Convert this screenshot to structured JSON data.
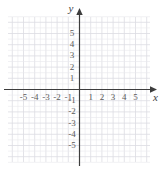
{
  "chart_data": {
    "type": "scatter",
    "title": "",
    "xlabel": "x",
    "ylabel": "y",
    "xlim": [
      -6,
      6
    ],
    "ylim": [
      -6,
      6
    ],
    "grid": true,
    "legend": null,
    "series": [],
    "x_ticks": [
      -5,
      -4,
      -3,
      -2,
      -1,
      1,
      2,
      3,
      4,
      5
    ],
    "y_ticks": [
      5,
      4,
      3,
      2,
      1,
      -1,
      -2,
      -3,
      -4,
      -5
    ],
    "x_tick_labels": [
      "-5",
      "-4",
      "-3",
      "-2",
      "-1",
      "1",
      "2",
      "3",
      "4",
      "5"
    ],
    "y_tick_labels": [
      "5",
      "4",
      "3",
      "2",
      "1",
      "-1",
      "-2",
      "-3",
      "-4",
      "-5"
    ],
    "annotations": []
  },
  "axes": {
    "x_name": "x",
    "y_name": "y"
  },
  "colors": {
    "grid": "#e8e8ec",
    "grid_major": "#dcdce2",
    "axis": "#3d3d3d",
    "label": "#5a5a5a",
    "background": "#ffffff"
  },
  "geometry": {
    "origin_x": 79.5,
    "origin_y": 89.5,
    "unit": 11.2,
    "grid_left": 8,
    "grid_right": 150,
    "grid_top": 17,
    "grid_bottom": 162
  }
}
